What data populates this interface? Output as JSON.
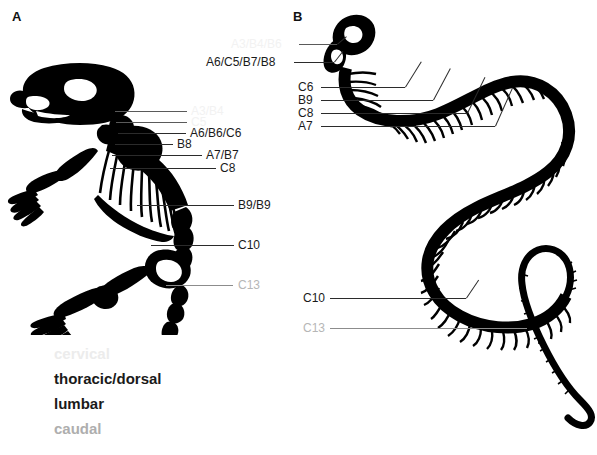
{
  "figure": {
    "background_color": "#ffffff",
    "width": 597,
    "height": 455
  },
  "panels": {
    "a": {
      "letter": "A",
      "subject": "mouse-skeleton"
    },
    "b": {
      "letter": "B",
      "subject": "snake-skeleton"
    }
  },
  "colors": {
    "cervical": "#f2f2f2",
    "thoracic_dorsal": "#1a1a1a",
    "lumbar": "#1a1a1a",
    "caudal": "#b6b6b6",
    "skeleton": "#000000",
    "leader_line": "#2b2b2b"
  },
  "legend": {
    "items": [
      {
        "label": "cervical",
        "color": "#ececec"
      },
      {
        "label": "thoracic/dorsal",
        "color": "#1a1a1a"
      },
      {
        "label": "lumbar",
        "color": "#1a1a1a"
      },
      {
        "label": "caudal",
        "color": "#aeaeae"
      }
    ]
  },
  "mouse_labels": [
    {
      "text": "A3/B4",
      "region": "cervical"
    },
    {
      "text": "C5",
      "region": "cervical"
    },
    {
      "text": "A6/B6/C6",
      "region": "thoracic"
    },
    {
      "text": "B8",
      "region": "thoracic"
    },
    {
      "text": "A7/B7",
      "region": "thoracic"
    },
    {
      "text": "C8",
      "region": "thoracic"
    },
    {
      "text": "B9/B9",
      "region": "thoracic"
    },
    {
      "text": "C10",
      "region": "lumbar"
    },
    {
      "text": "C13",
      "region": "caudal"
    }
  ],
  "snake_labels": [
    {
      "text": "A3/B4/B6",
      "region": "cervical"
    },
    {
      "text": "A6/C5/B7/B8",
      "region": "thoracic"
    },
    {
      "text": "C6",
      "region": "thoracic"
    },
    {
      "text": "B9",
      "region": "thoracic"
    },
    {
      "text": "C8",
      "region": "thoracic"
    },
    {
      "text": "A7",
      "region": "thoracic"
    },
    {
      "text": "C10",
      "region": "lumbar"
    },
    {
      "text": "C13",
      "region": "caudal"
    }
  ]
}
